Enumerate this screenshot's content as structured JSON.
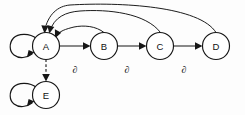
{
  "diagram": {
    "type": "directed-graph",
    "background_color": "#fdfdfd",
    "stroke_color": "#161616",
    "nodes": [
      {
        "id": "A",
        "label": "A",
        "cx": 46,
        "cy": 46,
        "r": 13.5
      },
      {
        "id": "B",
        "label": "B",
        "cx": 104,
        "cy": 46,
        "r": 13.5
      },
      {
        "id": "C",
        "label": "C",
        "cx": 160,
        "cy": 46,
        "r": 13.5
      },
      {
        "id": "D",
        "label": "D",
        "cx": 216,
        "cy": 46,
        "r": 13.5
      },
      {
        "id": "E",
        "label": "E",
        "cx": 46,
        "cy": 95,
        "r": 13.5
      }
    ],
    "edges": [
      {
        "id": "a-self",
        "from": "A",
        "to": "A",
        "style": "solid",
        "kind": "self-loop",
        "label": ""
      },
      {
        "id": "e-self",
        "from": "E",
        "to": "E",
        "style": "solid",
        "kind": "self-loop",
        "label": ""
      },
      {
        "id": "a-to-b",
        "from": "A",
        "to": "B",
        "style": "solid",
        "kind": "straight",
        "label": "∂"
      },
      {
        "id": "b-to-c",
        "from": "B",
        "to": "C",
        "style": "solid",
        "kind": "straight",
        "label": "∂"
      },
      {
        "id": "c-to-d",
        "from": "C",
        "to": "D",
        "style": "solid",
        "kind": "straight",
        "label": "∂"
      },
      {
        "id": "a-to-e",
        "from": "A",
        "to": "E",
        "style": "dashed",
        "kind": "straight",
        "label": ""
      },
      {
        "id": "b-to-a",
        "from": "B",
        "to": "A",
        "style": "solid",
        "kind": "arc-inner",
        "label": ""
      },
      {
        "id": "c-to-a",
        "from": "C",
        "to": "A",
        "style": "solid",
        "kind": "arc-middle",
        "label": ""
      },
      {
        "id": "d-to-a",
        "from": "D",
        "to": "A",
        "style": "solid",
        "kind": "arc-outer",
        "label": ""
      }
    ],
    "edge_labels": [
      {
        "id": "label-ab",
        "text": "∂",
        "x": 75,
        "y": 69
      },
      {
        "id": "label-bc",
        "text": "∂",
        "x": 127,
        "y": 69
      },
      {
        "id": "label-cd",
        "text": "∂",
        "x": 184,
        "y": 69
      }
    ]
  }
}
